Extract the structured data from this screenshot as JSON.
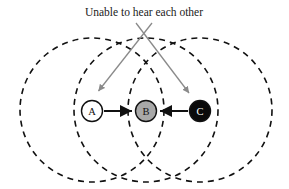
{
  "figure": {
    "annotation": {
      "text": "Unable to hear each other",
      "text_x": 144,
      "text_y": 16,
      "color": "#1a1a1a"
    },
    "background_color": "#ffffff"
  },
  "colors": {
    "range_circle_stroke": "#111111",
    "node_a_fill": "#ffffff",
    "node_b_fill": "#a8a8a8",
    "node_c_fill": "#0a0a0a",
    "node_stroke": "#111111",
    "link_arrow": "#111111",
    "pointer_arrow": "#8a8a8a"
  },
  "nodes": [
    {
      "id": "A",
      "label": "A",
      "cx": 92,
      "cy": 111,
      "r": 10.5,
      "fill_key": "node_a_fill",
      "label_color": "dark"
    },
    {
      "id": "B",
      "label": "B",
      "cx": 146,
      "cy": 111,
      "r": 10.5,
      "fill_key": "node_b_fill",
      "label_color": "dark"
    },
    {
      "id": "C",
      "label": "C",
      "cx": 200,
      "cy": 111,
      "r": 10.5,
      "fill_key": "node_c_fill",
      "label_color": "light"
    }
  ],
  "range_circles": [
    {
      "id": "range-a",
      "center_node": "A",
      "cx": 92,
      "cy": 110,
      "r": 72
    },
    {
      "id": "range-b",
      "center_node": "B",
      "cx": 146,
      "cy": 110,
      "r": 72
    },
    {
      "id": "range-c",
      "center_node": "C",
      "cx": 200,
      "cy": 110,
      "r": 72
    }
  ],
  "links": [
    {
      "id": "link-a-b",
      "from": "A",
      "to": "B",
      "x1": 104,
      "y1": 111,
      "x2": 133,
      "y2": 111,
      "direction": "forward"
    },
    {
      "id": "link-c-b",
      "from": "C",
      "to": "B",
      "x1": 188,
      "y1": 111,
      "x2": 159,
      "y2": 111,
      "direction": "forward"
    }
  ],
  "pointers": [
    {
      "id": "pointer-to-a",
      "x1": 152,
      "y1": 23,
      "x2": 98,
      "y2": 92
    },
    {
      "id": "pointer-to-c",
      "x1": 136,
      "y1": 23,
      "x2": 190,
      "y2": 94
    }
  ],
  "geometry": {
    "width": 289,
    "height": 189,
    "dash_pattern": "6,5",
    "circle_stroke_width": 1.6,
    "node_stroke_width": 1.4,
    "link_stroke_width": 2.0,
    "pointer_stroke_width": 1.3
  }
}
